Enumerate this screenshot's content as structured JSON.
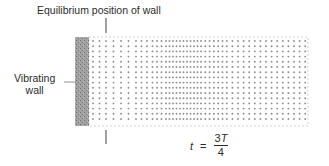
{
  "labels": {
    "equilibrium": "Equilibrium position of wall",
    "wall_line1": "Vibrating",
    "wall_line2": "wall"
  },
  "equation": {
    "variable": "t",
    "equals": "=",
    "numerator_coef": "3",
    "numerator_var": "T",
    "denominator": "4"
  },
  "colors": {
    "wall": "#9a9a9a",
    "dots": "#8f8f8f",
    "lines": "#444444",
    "box_border": "#bdbdbd"
  }
}
